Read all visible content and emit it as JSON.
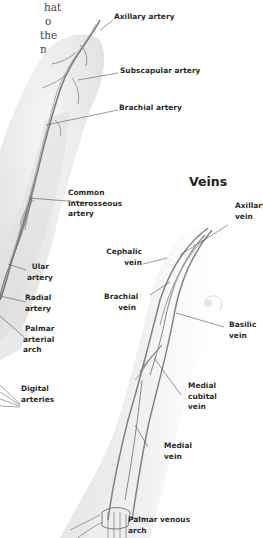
{
  "intro_text": {
    "lines": [
      "hat",
      "o",
      "the",
      "n"
    ]
  },
  "arteries": {
    "labels": {
      "axillary_artery": [
        "Axillary artery"
      ],
      "subscapular_artery": [
        "Subscapular artery"
      ],
      "brachial_artery": [
        "Brachial artery"
      ],
      "common_interosseous_artery": [
        "Common",
        "interosseous",
        "artery"
      ],
      "ulnar_artery": [
        "Ular",
        "artery"
      ],
      "radial_artery": [
        "Radial",
        "artery"
      ],
      "palmar_arterial_arch": [
        "Palmar",
        "arterial",
        "arch"
      ],
      "digital_arteries": [
        "Digital",
        "arteries"
      ]
    }
  },
  "veins": {
    "title": "Veins",
    "labels": {
      "axillary_vein": [
        "Axillary",
        "vein"
      ],
      "cephalic_vein": [
        "Cephalic",
        "vein"
      ],
      "brachial_vein": [
        "Brachial",
        "vein"
      ],
      "basilic_vein": [
        "Basilic",
        "vein"
      ],
      "medial_cubital_vein": [
        "Medial",
        "cubital",
        "vein"
      ],
      "medial_vein": [
        "Medial",
        "vein"
      ],
      "palmar_venous_arch": [
        "Palmar venous",
        "arch"
      ]
    }
  },
  "colors": {
    "skin_light": "#f2f2f2",
    "skin_shade": "#dcdcdc",
    "vessel": "#8a8a8a",
    "vessel_dark": "#6a6a6a",
    "leader_line": "#555555",
    "label_text": "#2a2a2a"
  }
}
